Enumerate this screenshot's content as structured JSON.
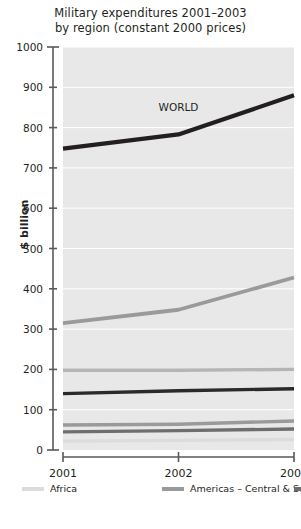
{
  "chart_data": {
    "type": "line",
    "title": "Military expenditures 2001–2003 by region (constant 2000 prices)",
    "title_lines": [
      "Military expenditures 2001–2003",
      "by region (constant 2000 prices)"
    ],
    "xlabel": "",
    "ylabel": "$ billion",
    "x": [
      "2001",
      "2002",
      "2003"
    ],
    "xtick_labels": [
      "2001",
      "2002",
      "2003"
    ],
    "ytick_labels": [
      "0",
      "100",
      "200",
      "300",
      "400",
      "500",
      "600",
      "700",
      "800",
      "900",
      "1000"
    ],
    "ytick_values": [
      0,
      100,
      200,
      300,
      400,
      500,
      600,
      700,
      800,
      900,
      1000
    ],
    "ylim": [
      0,
      1000
    ],
    "grid": "horizontal-white",
    "legend_position": "below-axis-two-columns",
    "annotations": [
      {
        "text": "WORLD",
        "x": "2002",
        "y": 840
      }
    ],
    "series": [
      {
        "name": "WORLD",
        "values": [
          748,
          783,
          880
        ],
        "color": "#231f20",
        "width": 4.2,
        "in_legend": false
      },
      {
        "name": "Africa",
        "values": [
          22,
          24,
          26
        ],
        "color": "#dcdcdc",
        "width": 3.4,
        "in_legend": true
      },
      {
        "name": "Americas – Central & South",
        "values": [
          62,
          64,
          72
        ],
        "color": "#9a9a9a",
        "width": 3.4,
        "in_legend": true
      },
      {
        "name": "Middle East",
        "values": [
          45,
          48,
          52
        ],
        "color": "#6e6e6e",
        "width": 3.4,
        "in_legend": true
      },
      {
        "name": "Asia & Oceania",
        "values": [
          140,
          147,
          152
        ],
        "color": "#2a2a2a",
        "width": 3.4,
        "in_legend": true
      },
      {
        "name": "Europe",
        "values": [
          315,
          348,
          428
        ],
        "color": "#9a9a9a",
        "width": 3.8,
        "in_legend": true
      },
      {
        "name": "Americas – North",
        "values": [
          198,
          198,
          200
        ],
        "color": "#b5b5b5",
        "width": 3.4,
        "in_legend": true
      }
    ]
  },
  "legend": {
    "entries": [
      {
        "label": "Africa",
        "color": "#dcdcdc"
      },
      {
        "label": "Americas – Central & South",
        "color": "#9a9a9a"
      },
      {
        "label": "Middle East",
        "color": "#6e6e6e"
      },
      {
        "label": "Asia & Oceania",
        "color": "#2a2a2a"
      },
      {
        "label": "Europe",
        "color": "#9a9a9a"
      },
      {
        "label": "Americas – North",
        "color": "#b5b5b5"
      }
    ]
  },
  "style": {
    "plot_background": "#e8e8e8",
    "gridline_color": "#ffffff",
    "axis_color": "#58595b",
    "text_color": "#231f20"
  }
}
